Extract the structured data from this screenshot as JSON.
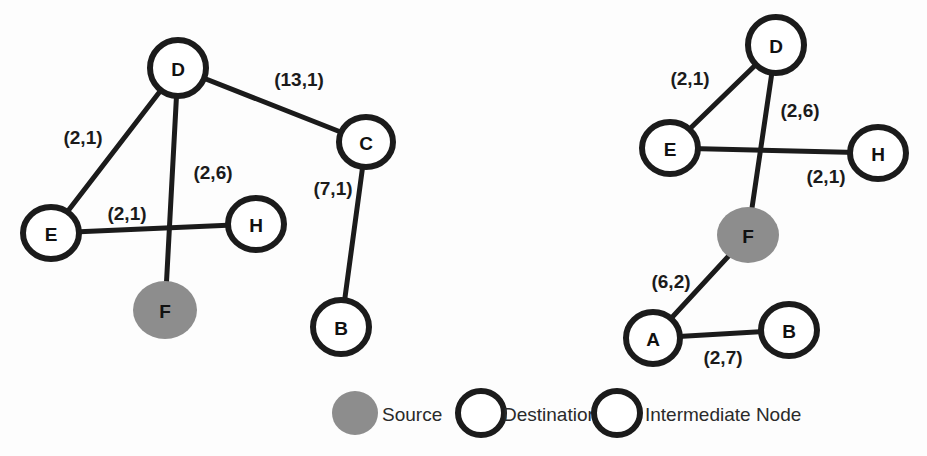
{
  "diagram": {
    "colors": {
      "source_fill": "#8d8d8d",
      "node_stroke": "#1b1b1b",
      "node_fill": "#ffffff",
      "edge_stroke": "#1b1b1b",
      "background": "#fdfdfd"
    }
  },
  "graphs": [
    {
      "id": "left-graph",
      "name": "left-network-graph",
      "nodes": [
        {
          "id": "L-D",
          "label": "D",
          "type": "destination",
          "cx": 178,
          "cy": 68,
          "rx": 28,
          "ry": 28
        },
        {
          "id": "L-C",
          "label": "C",
          "type": "intermediate",
          "cx": 366,
          "cy": 142,
          "rx": 27,
          "ry": 25
        },
        {
          "id": "L-E",
          "label": "E",
          "type": "destination",
          "cx": 51,
          "cy": 233,
          "rx": 28,
          "ry": 26
        },
        {
          "id": "L-H",
          "label": "H",
          "type": "destination",
          "cx": 256,
          "cy": 224,
          "rx": 28,
          "ry": 26
        },
        {
          "id": "L-F",
          "label": "F",
          "type": "source",
          "cx": 165,
          "cy": 310,
          "rx": 32,
          "ry": 29
        },
        {
          "id": "L-B",
          "label": "B",
          "type": "destination",
          "cx": 341,
          "cy": 327,
          "rx": 28,
          "ry": 27
        }
      ],
      "edges": [
        {
          "id": "L-D-E",
          "from": "L-D",
          "to": "L-E",
          "weight": "(2,1)",
          "lx": 83,
          "ly": 137
        },
        {
          "id": "L-D-C",
          "from": "L-D",
          "to": "L-C",
          "weight": "(13,1)",
          "lx": 299,
          "ly": 79
        },
        {
          "id": "L-D-F",
          "from": "L-D",
          "to": "L-F",
          "weight": "(2,6)",
          "lx": 213,
          "ly": 172
        },
        {
          "id": "L-E-H",
          "from": "L-E",
          "to": "L-H",
          "weight": "(2,1)",
          "lx": 127,
          "ly": 213
        },
        {
          "id": "L-C-B",
          "from": "L-C",
          "to": "L-B",
          "weight": "(7,1)",
          "lx": 333,
          "ly": 188
        }
      ]
    },
    {
      "id": "right-graph",
      "name": "right-network-graph",
      "nodes": [
        {
          "id": "R-D",
          "label": "D",
          "type": "destination",
          "cx": 776,
          "cy": 45,
          "rx": 28,
          "ry": 28
        },
        {
          "id": "R-E",
          "label": "E",
          "type": "destination",
          "cx": 670,
          "cy": 148,
          "rx": 28,
          "ry": 26
        },
        {
          "id": "R-H",
          "label": "H",
          "type": "destination",
          "cx": 878,
          "cy": 153,
          "rx": 28,
          "ry": 26
        },
        {
          "id": "R-F",
          "label": "F",
          "type": "source",
          "cx": 748,
          "cy": 235,
          "rx": 31,
          "ry": 28
        },
        {
          "id": "R-A",
          "label": "A",
          "type": "intermediate",
          "cx": 653,
          "cy": 338,
          "rx": 27,
          "ry": 26
        },
        {
          "id": "R-B",
          "label": "B",
          "type": "destination",
          "cx": 789,
          "cy": 330,
          "rx": 28,
          "ry": 26
        }
      ],
      "edges": [
        {
          "id": "R-D-E",
          "from": "R-D",
          "to": "R-E",
          "weight": "(2,1)",
          "lx": 690,
          "ly": 78
        },
        {
          "id": "R-D-F",
          "from": "R-D",
          "to": "R-F",
          "weight": "(2,6)",
          "lx": 800,
          "ly": 110
        },
        {
          "id": "R-E-H",
          "from": "R-E",
          "to": "R-H",
          "weight": "(2,1)",
          "lx": 826,
          "ly": 176
        },
        {
          "id": "R-F-A",
          "from": "R-F",
          "to": "R-A",
          "weight": "(6,2)",
          "lx": 671,
          "ly": 281
        },
        {
          "id": "R-A-B",
          "from": "R-A",
          "to": "R-B",
          "weight": "(2,7)",
          "lx": 723,
          "ly": 357
        }
      ]
    }
  ],
  "legend": {
    "name": "node-type-legend",
    "items": [
      {
        "id": "legend-source",
        "label": "Source",
        "type": "source",
        "cx": 355,
        "cy": 413,
        "rx": 23,
        "ry": 22,
        "tx": 382
      },
      {
        "id": "legend-destination",
        "label": "Destination",
        "type": "destination",
        "cx": 481,
        "cy": 413,
        "rx": 23,
        "ry": 22,
        "tx": 503
      },
      {
        "id": "legend-intermediate",
        "label": "Intermediate Node",
        "type": "intermediate",
        "cx": 617,
        "cy": 413,
        "rx": 23,
        "ry": 22,
        "tx": 645
      }
    ]
  }
}
